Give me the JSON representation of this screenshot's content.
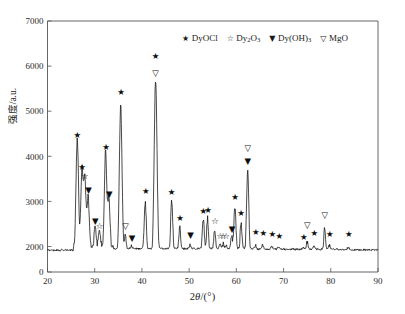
{
  "chart_data": {
    "type": "line",
    "title": "",
    "subtitle": "",
    "xlabel": "2θ/(°)",
    "ylabel": "强度/a.u.",
    "xlim": [
      20,
      90
    ],
    "ylim": [
      0,
      7000
    ],
    "grid": false,
    "legend_position": "top-center",
    "xticks": [
      20,
      30,
      40,
      50,
      60,
      70,
      80,
      90
    ],
    "yticks": [
      0,
      2000,
      3000,
      4000,
      5000,
      6000,
      7000
    ],
    "y_axis_broken": true,
    "y_axis_break_note": "axis jumps from 0 directly to 2000",
    "baseline_intensity": 1800,
    "series": [
      {
        "name": "XRD pattern",
        "color": "#0d0d0d",
        "peaks": [
          {
            "x": 26.3,
            "y": 4230,
            "phase": "DyOCl"
          },
          {
            "x": 27.3,
            "y": 3530,
            "phase": "DyOCl"
          },
          {
            "x": 27.9,
            "y": 3340,
            "phase": "Dy2O3"
          },
          {
            "x": 28.6,
            "y": 2960,
            "phase": "Dy(OH)3"
          },
          {
            "x": 30.1,
            "y": 2330,
            "phase": "Dy(OH)3"
          },
          {
            "x": 31.0,
            "y": 2230,
            "phase": "Dy2O3"
          },
          {
            "x": 32.3,
            "y": 3940,
            "phase": "DyOCl"
          },
          {
            "x": 33.0,
            "y": 2940,
            "phase": "Dy(OH)3"
          },
          {
            "x": 35.5,
            "y": 5110,
            "phase": "DyOCl"
          },
          {
            "x": 36.5,
            "y": 2210,
            "phase": "MgO"
          },
          {
            "x": 37.8,
            "y": 1980,
            "phase": "Dy(OH)3"
          },
          {
            "x": 40.7,
            "y": 2970,
            "phase": "DyOCl"
          },
          {
            "x": 42.9,
            "y": 5700,
            "phase": "DyOCl,MgO"
          },
          {
            "x": 46.3,
            "y": 2970,
            "phase": "DyOCl"
          },
          {
            "x": 48.0,
            "y": 2400,
            "phase": "DyOCl"
          },
          {
            "x": 50.2,
            "y": 2020,
            "phase": "Dy(OH)3"
          },
          {
            "x": 53.0,
            "y": 2560,
            "phase": "DyOCl"
          },
          {
            "x": 53.9,
            "y": 2580,
            "phase": "DyOCl"
          },
          {
            "x": 55.4,
            "y": 2350,
            "phase": "Dy2O3"
          },
          {
            "x": 56.6,
            "y": 2000,
            "phase": "Dy2O3"
          },
          {
            "x": 57.2,
            "y": 1990,
            "phase": "Dy2O3"
          },
          {
            "x": 57.8,
            "y": 1990,
            "phase": "Dy2O3"
          },
          {
            "x": 59.0,
            "y": 2160,
            "phase": "Dy(OH)3"
          },
          {
            "x": 59.7,
            "y": 2840,
            "phase": "DyOCl"
          },
          {
            "x": 61.0,
            "y": 2480,
            "phase": "DyOCl"
          },
          {
            "x": 62.4,
            "y": 3640,
            "phase": "Dy(OH)3,MgO"
          },
          {
            "x": 64.0,
            "y": 2030,
            "phase": "DyOCl"
          },
          {
            "x": 65.6,
            "y": 2020,
            "phase": "DyOCl"
          },
          {
            "x": 67.5,
            "y": 2000,
            "phase": "DyOCl"
          },
          {
            "x": 69.0,
            "y": 1980,
            "phase": "DyOCl"
          },
          {
            "x": 74.2,
            "y": 1960,
            "phase": "DyOCl"
          },
          {
            "x": 75.0,
            "y": 2090,
            "phase": "MgO"
          },
          {
            "x": 76.4,
            "y": 2030,
            "phase": "DyOCl"
          },
          {
            "x": 78.7,
            "y": 2430,
            "phase": "MgO"
          },
          {
            "x": 79.7,
            "y": 2020,
            "phase": "DyOCl"
          },
          {
            "x": 83.7,
            "y": 1990,
            "phase": "DyOCl"
          }
        ]
      }
    ],
    "annotations": [
      {
        "x": 26.3,
        "y": 4400,
        "symbol": "★",
        "phase": "DyOCl"
      },
      {
        "x": 27.3,
        "y": 3690,
        "symbol": "★",
        "phase": "DyOCl"
      },
      {
        "x": 27.9,
        "y": 3500,
        "symbol": "☆",
        "phase": "Dy2O3"
      },
      {
        "x": 28.7,
        "y": 3190,
        "symbol": "▼",
        "phase": "Dy(OH)3"
      },
      {
        "x": 30.1,
        "y": 2510,
        "symbol": "▼",
        "phase": "Dy(OH)3"
      },
      {
        "x": 31.0,
        "y": 2390,
        "symbol": "☆",
        "phase": "Dy2O3"
      },
      {
        "x": 32.4,
        "y": 4130,
        "symbol": "★",
        "phase": "DyOCl"
      },
      {
        "x": 33.1,
        "y": 3100,
        "symbol": "▼",
        "phase": "Dy(OH)3"
      },
      {
        "x": 35.6,
        "y": 5350,
        "symbol": "★",
        "phase": "DyOCl"
      },
      {
        "x": 36.5,
        "y": 2390,
        "symbol": "▽",
        "phase": "MgO"
      },
      {
        "x": 37.9,
        "y": 2130,
        "symbol": "▼",
        "phase": "Dy(OH)3"
      },
      {
        "x": 40.8,
        "y": 3160,
        "symbol": "★",
        "phase": "DyOCl"
      },
      {
        "x": 42.9,
        "y": 6150,
        "symbol": "★",
        "phase": "DyOCl"
      },
      {
        "x": 42.9,
        "y": 5780,
        "symbol": "▽",
        "phase": "MgO"
      },
      {
        "x": 46.3,
        "y": 3150,
        "symbol": "★",
        "phase": "DyOCl"
      },
      {
        "x": 48.1,
        "y": 2570,
        "symbol": "★",
        "phase": "DyOCl"
      },
      {
        "x": 50.3,
        "y": 2180,
        "symbol": "▼",
        "phase": "Dy(OH)3"
      },
      {
        "x": 53.0,
        "y": 2730,
        "symbol": "★",
        "phase": "DyOCl"
      },
      {
        "x": 54.0,
        "y": 2740,
        "symbol": "★",
        "phase": "DyOCl"
      },
      {
        "x": 55.5,
        "y": 2490,
        "symbol": "☆",
        "phase": "Dy2O3"
      },
      {
        "x": 56.6,
        "y": 2160,
        "symbol": "☆",
        "phase": "Dy2O3"
      },
      {
        "x": 57.2,
        "y": 2160,
        "symbol": "☆",
        "phase": "Dy2O3"
      },
      {
        "x": 57.8,
        "y": 2160,
        "symbol": "☆",
        "phase": "Dy2O3"
      },
      {
        "x": 59.1,
        "y": 2330,
        "symbol": "▼",
        "phase": "Dy(OH)3"
      },
      {
        "x": 59.7,
        "y": 3040,
        "symbol": "★",
        "phase": "DyOCl"
      },
      {
        "x": 61.0,
        "y": 2680,
        "symbol": "★",
        "phase": "DyOCl"
      },
      {
        "x": 62.4,
        "y": 4120,
        "symbol": "▽",
        "phase": "MgO"
      },
      {
        "x": 62.4,
        "y": 3840,
        "symbol": "▼",
        "phase": "Dy(OH)3"
      },
      {
        "x": 64.1,
        "y": 2250,
        "symbol": "★",
        "phase": "DyOCl"
      },
      {
        "x": 65.7,
        "y": 2230,
        "symbol": "★",
        "phase": "DyOCl"
      },
      {
        "x": 67.6,
        "y": 2210,
        "symbol": "★",
        "phase": "DyOCl"
      },
      {
        "x": 69.1,
        "y": 2170,
        "symbol": "★",
        "phase": "DyOCl"
      },
      {
        "x": 74.3,
        "y": 2140,
        "symbol": "★",
        "phase": "DyOCl"
      },
      {
        "x": 75.0,
        "y": 2400,
        "symbol": "▽",
        "phase": "MgO"
      },
      {
        "x": 76.5,
        "y": 2230,
        "symbol": "★",
        "phase": "DyOCl"
      },
      {
        "x": 78.7,
        "y": 2640,
        "symbol": "▽",
        "phase": "MgO"
      },
      {
        "x": 79.8,
        "y": 2220,
        "symbol": "★",
        "phase": "DyOCl"
      },
      {
        "x": 83.8,
        "y": 2220,
        "symbol": "★",
        "phase": "DyOCl"
      }
    ],
    "legend": [
      {
        "symbol": "★",
        "label_main": "DyOCl",
        "label_sub": "",
        "label_tail": ""
      },
      {
        "symbol": "☆",
        "label_main": "Dy",
        "label_sub": "2",
        "label_tail": "O",
        "label_sub2": "3"
      },
      {
        "symbol": "▼",
        "label_main": "Dy(OH)",
        "label_sub": "3",
        "label_tail": ""
      },
      {
        "symbol": "▽",
        "label_main": "MgO",
        "label_sub": "",
        "label_tail": ""
      }
    ]
  },
  "axis": {
    "x_title_prefix": "2",
    "x_title_theta": "θ",
    "x_title_suffix": "/(°)",
    "y_title": "强度/a.u."
  }
}
